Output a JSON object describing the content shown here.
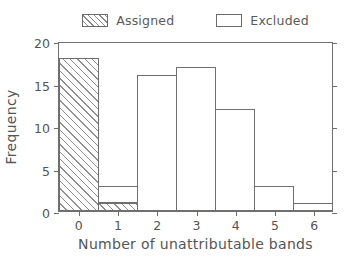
{
  "chart_data": {
    "type": "bar",
    "title": "",
    "subtitle": "",
    "xlabel": "Number of unattributable bands",
    "ylabel": "Frequency",
    "categories": [
      "0",
      "1",
      "2",
      "3",
      "4",
      "5",
      "6"
    ],
    "x": [
      0,
      1,
      2,
      3,
      4,
      5,
      6
    ],
    "series": [
      {
        "name": "Assigned",
        "fill": "hatched",
        "values": [
          18,
          1,
          0,
          0,
          0,
          0,
          0
        ]
      },
      {
        "name": "Excluded",
        "fill": "empty",
        "values": [
          0,
          2,
          16,
          17,
          12,
          3,
          1
        ]
      }
    ],
    "totals": [
      18,
      3,
      16,
      17,
      12,
      3,
      1
    ],
    "xlim": [
      -0.5,
      6.5
    ],
    "ylim": [
      0,
      20
    ],
    "yticks": [
      0,
      5,
      10,
      15,
      20
    ],
    "ytick_labels": [
      "0",
      "5",
      "10",
      "15",
      "20"
    ],
    "xticks": [
      0,
      1,
      2,
      3,
      4,
      5,
      6
    ],
    "xtick_labels": [
      "0",
      "1",
      "2",
      "3",
      "4",
      "5",
      "6"
    ],
    "grid": false,
    "legend_position": "top-center",
    "legend": [
      "Assigned",
      "Excluded"
    ],
    "colors": {
      "axis": "#6e6e6e",
      "text": "#555555",
      "bar_edge": "#6e6e6e",
      "bar_face": "#ffffff",
      "hatch": "#8f8f8f",
      "background": "#ffffff"
    }
  },
  "legend": {
    "items": [
      {
        "label": "Assigned",
        "swatch": "hatched-box-icon"
      },
      {
        "label": "Excluded",
        "swatch": "empty-box-icon"
      }
    ]
  },
  "axes": {
    "y_title": "Frequency",
    "x_title": "Number of unattributable bands"
  }
}
